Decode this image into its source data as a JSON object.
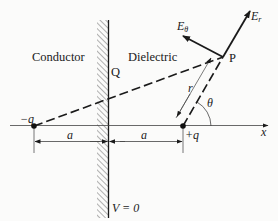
{
  "diagram": {
    "regions": {
      "left": "Conductor",
      "right": "Dielectric"
    },
    "points": {
      "surface_point": "Q",
      "field_point": "P"
    },
    "charges": {
      "image_charge": "−q",
      "real_charge": "+q"
    },
    "vectors": {
      "radial_field": "E",
      "radial_sub": "r",
      "angular_field": "E",
      "angular_sub": "θ"
    },
    "labels": {
      "radius": "r",
      "angle": "θ",
      "x_axis": "x",
      "distance_left": "a",
      "distance_right": "a",
      "potential": "V = 0"
    },
    "colors": {
      "ink": "#1a1a1a",
      "hatch": "#555555",
      "background": "#fbfbfa"
    }
  }
}
